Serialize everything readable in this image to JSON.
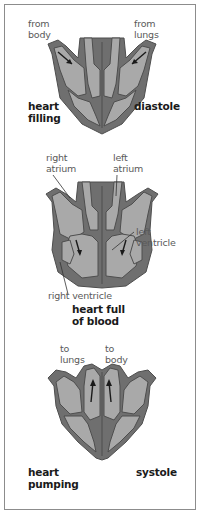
{
  "colors": {
    "muscle": "#6f6f6f",
    "chamber": "#a9a9a9",
    "outline": "#4e4e4e",
    "arrow": "#1a1a1a",
    "label": "#5a5a5a",
    "border": "#8c8c8c"
  },
  "panels": [
    {
      "id": "diastole",
      "labels": {
        "inflow_left": [
          "from",
          "body"
        ],
        "inflow_right": [
          "from",
          "lungs"
        ]
      },
      "caption_left": [
        "heart",
        "filling"
      ],
      "caption_right": [
        "diastole"
      ]
    },
    {
      "id": "full",
      "labels": {
        "right_atrium": [
          "right",
          "atrium"
        ],
        "left_atrium": [
          "left",
          "atrium"
        ],
        "left_ventricle": [
          "left",
          "ventricle"
        ],
        "right_ventricle": [
          "right ventricle"
        ]
      },
      "caption_center": [
        "heart full",
        "of blood"
      ]
    },
    {
      "id": "systole",
      "labels": {
        "outflow_left": [
          "to",
          "lungs"
        ],
        "outflow_right": [
          "to",
          "body"
        ]
      },
      "caption_left": [
        "heart",
        "pumping"
      ],
      "caption_right": [
        "systole"
      ]
    }
  ]
}
